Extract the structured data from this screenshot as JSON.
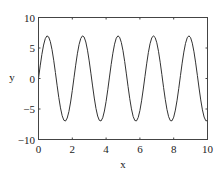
{
  "chart_data": {
    "type": "line",
    "title": "",
    "xlabel": "x",
    "ylabel": "y",
    "xlim": [
      0,
      10
    ],
    "ylim": [
      -10,
      10
    ],
    "xticks": [
      0,
      2,
      4,
      6,
      8,
      10
    ],
    "yticks": [
      -10,
      -5,
      0,
      5,
      10
    ],
    "xtick_labels": [
      "0",
      "2",
      "4",
      "6",
      "8",
      "10"
    ],
    "ytick_labels": [
      "−10",
      "−5",
      "0",
      "5",
      "10"
    ],
    "grid": false,
    "legend": null,
    "series": [
      {
        "name": "y = 7 sin(3x)",
        "function": "7*sin(3*x)",
        "x_step": 0.1,
        "color": "#333333",
        "approx_peaks_x": [
          0.52,
          2.62,
          4.71,
          6.81,
          8.9
        ],
        "approx_troughs_x": [
          1.57,
          3.67,
          5.76,
          7.85,
          9.95
        ],
        "amplitude": 7
      }
    ]
  },
  "colors": {
    "line": "#333333",
    "axes": "#444444",
    "background": "#ffffff"
  }
}
